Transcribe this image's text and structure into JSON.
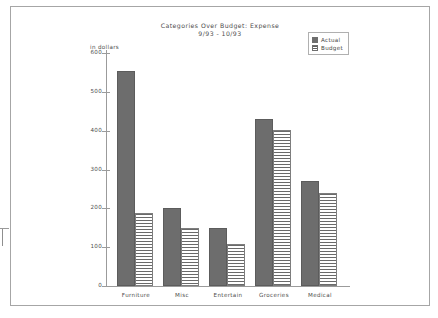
{
  "chart_data": {
    "type": "bar",
    "title": "Categories Over Budget: Expense",
    "subtitle": "9/93 - 10/93",
    "xlabel": "",
    "ylabel": "in dollars",
    "ylim": [
      0,
      600
    ],
    "yticks": [
      0,
      100,
      200,
      300,
      400,
      500,
      600
    ],
    "ytick_labels": [
      "0",
      "100",
      "200",
      "300",
      "400",
      "500",
      "600"
    ],
    "grid": false,
    "legend_position": "top-right",
    "categories": [
      "Furniture",
      "Misc",
      "Entertain",
      "Groceries",
      "Medical"
    ],
    "series": [
      {
        "name": "Actual",
        "fill": "solid",
        "color": "#6d6d6d",
        "values": [
          554,
          200,
          150,
          430,
          270
        ]
      },
      {
        "name": "Budget",
        "fill": "horizontal-stripes",
        "color": "#6a6a6a",
        "values": [
          188,
          150,
          108,
          403,
          240
        ]
      }
    ]
  },
  "legend": {
    "items": [
      {
        "label": "Actual",
        "swatch": "solid"
      },
      {
        "label": "Budget",
        "swatch": "striped"
      }
    ]
  }
}
